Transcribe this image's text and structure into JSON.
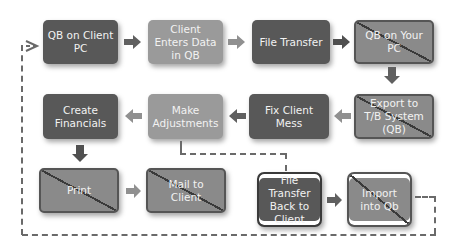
{
  "diagram": {
    "title": "",
    "nodes": [
      {
        "id": "qb_client_pc",
        "label": "QB on Client PC",
        "style": "dark",
        "crossed": false
      },
      {
        "id": "client_enters",
        "label": "Client Enters Data in QB",
        "style": "light",
        "crossed": false
      },
      {
        "id": "file_transfer",
        "label": "File Transfer",
        "style": "dark",
        "crossed": false
      },
      {
        "id": "qb_your_pc",
        "label": "QB on Your PC",
        "style": "crossed",
        "crossed": true
      },
      {
        "id": "export_tb",
        "label": "Export to T/B System (QB)",
        "style": "crossed",
        "crossed": true
      },
      {
        "id": "fix_client_mess",
        "label": "Fix Client Mess",
        "style": "dark",
        "crossed": false
      },
      {
        "id": "make_adjustments",
        "label": "Make Adjustments",
        "style": "light",
        "crossed": false
      },
      {
        "id": "create_financials",
        "label": "Create Financials",
        "style": "dark",
        "crossed": false
      },
      {
        "id": "print",
        "label": "Print",
        "style": "crossed",
        "crossed": true
      },
      {
        "id": "mail_client",
        "label": "Mail to Client",
        "style": "crossed",
        "crossed": true
      },
      {
        "id": "file_transfer_back",
        "label": "File Transfer Back to Client",
        "style": "dark-banded",
        "crossed": false
      },
      {
        "id": "import_qb",
        "label": "Import into Qb",
        "style": "crossed-banded",
        "crossed": true
      }
    ],
    "edges": [
      {
        "from": "qb_client_pc",
        "to": "client_enters",
        "type": "solid"
      },
      {
        "from": "client_enters",
        "to": "file_transfer",
        "type": "solid"
      },
      {
        "from": "file_transfer",
        "to": "qb_your_pc",
        "type": "solid"
      },
      {
        "from": "qb_your_pc",
        "to": "export_tb",
        "type": "solid"
      },
      {
        "from": "export_tb",
        "to": "fix_client_mess",
        "type": "solid"
      },
      {
        "from": "fix_client_mess",
        "to": "make_adjustments",
        "type": "solid"
      },
      {
        "from": "make_adjustments",
        "to": "create_financials",
        "type": "solid"
      },
      {
        "from": "create_financials",
        "to": "print",
        "type": "solid"
      },
      {
        "from": "print",
        "to": "mail_client",
        "type": "solid"
      },
      {
        "from": "make_adjustments",
        "to": "file_transfer_back",
        "type": "dashed"
      },
      {
        "from": "file_transfer_back",
        "to": "import_qb",
        "type": "solid"
      },
      {
        "from": "import_qb",
        "to": "qb_client_pc",
        "type": "dashed"
      }
    ],
    "colors": {
      "dark": "#585858",
      "light": "#9a9a9a",
      "crossed": "#8a8a8a",
      "arrow": "#606060",
      "dash": "#6a6a6a"
    }
  }
}
